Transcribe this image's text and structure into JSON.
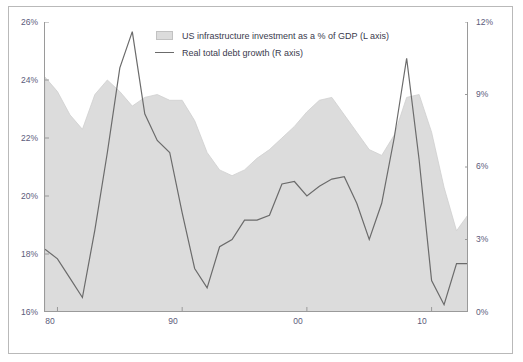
{
  "chart_data": {
    "type": "area",
    "title": "",
    "xlabel": "",
    "ylabel": "",
    "grid": false,
    "legend_position": "top-center",
    "x_tick_labels": [
      "80",
      "90",
      "00",
      "10"
    ],
    "x_tick_values": [
      1980,
      1990,
      2000,
      2010
    ],
    "xlim": [
      1979,
      2013
    ],
    "left_axis": {
      "label": "US infrastructure investment as a % of GDP (L axis)",
      "tick_labels": [
        "16%",
        "18%",
        "20%",
        "22%",
        "24%",
        "26%"
      ],
      "tick_values": [
        16,
        18,
        20,
        22,
        24,
        26
      ],
      "ylim": [
        16,
        26
      ],
      "color": "#dcdcdc"
    },
    "right_axis": {
      "label": "Real total debt growth (R axis)",
      "tick_labels": [
        "0%",
        "3%",
        "6%",
        "9%",
        "12%"
      ],
      "tick_values": [
        0,
        3,
        6,
        9,
        12
      ],
      "ylim": [
        0,
        12
      ],
      "color": "#6b6b6b"
    },
    "series": [
      {
        "name": "US infrastructure investment as a % of GDP (L axis)",
        "axis": "left",
        "type": "area",
        "x": [
          1979,
          1980,
          1981,
          1982,
          1983,
          1984,
          1985,
          1986,
          1987,
          1988,
          1989,
          1990,
          1991,
          1992,
          1993,
          1994,
          1995,
          1996,
          1997,
          1998,
          1999,
          2000,
          2001,
          2002,
          2003,
          2004,
          2005,
          2006,
          2007,
          2008,
          2009,
          2010,
          2011,
          2012,
          2013
        ],
        "values": [
          24.1,
          23.6,
          22.8,
          22.3,
          23.5,
          24.0,
          23.6,
          23.1,
          23.4,
          23.5,
          23.3,
          23.3,
          22.6,
          21.5,
          20.9,
          20.7,
          20.9,
          21.3,
          21.6,
          22.0,
          22.4,
          22.9,
          23.3,
          23.4,
          22.8,
          22.2,
          21.6,
          21.4,
          22.1,
          23.4,
          23.5,
          22.2,
          20.3,
          18.8,
          19.4
        ]
      },
      {
        "name": "Real total debt growth (R axis)",
        "axis": "right",
        "type": "line",
        "x": [
          1979,
          1980,
          1981,
          1982,
          1983,
          1984,
          1985,
          1986,
          1987,
          1988,
          1989,
          1990,
          1991,
          1992,
          1993,
          1994,
          1995,
          1996,
          1997,
          1998,
          1999,
          2000,
          2001,
          2002,
          2003,
          2004,
          2005,
          2006,
          2007,
          2008,
          2009,
          2010,
          2011,
          2012,
          2013
        ],
        "values": [
          2.6,
          2.2,
          1.4,
          0.6,
          3.4,
          6.6,
          10.1,
          11.6,
          8.2,
          7.1,
          6.6,
          4.1,
          1.8,
          1.0,
          2.7,
          3.0,
          3.8,
          3.8,
          4.0,
          5.3,
          5.4,
          4.8,
          5.2,
          5.5,
          5.6,
          4.5,
          3.0,
          4.5,
          7.2,
          10.5,
          6.3,
          1.3,
          0.3,
          2.0,
          2.0
        ]
      }
    ]
  },
  "legend": {
    "items": [
      {
        "label": "US infrastructure investment as a % of GDP (L axis)",
        "marker": "box"
      },
      {
        "label": "Real total debt growth (R axis)",
        "marker": "line"
      }
    ]
  },
  "axis_left_ticks": [
    {
      "label": "26%",
      "value": 26
    },
    {
      "label": "24%",
      "value": 24
    },
    {
      "label": "22%",
      "value": 22
    },
    {
      "label": "20%",
      "value": 20
    },
    {
      "label": "18%",
      "value": 18
    },
    {
      "label": "16%",
      "value": 16
    }
  ],
  "axis_right_ticks": [
    {
      "label": "12%",
      "value": 12
    },
    {
      "label": "9%",
      "value": 9
    },
    {
      "label": "6%",
      "value": 6
    },
    {
      "label": "3%",
      "value": 3
    },
    {
      "label": "0%",
      "value": 0
    }
  ],
  "axis_x_ticks": [
    {
      "label": "80",
      "value": 1980
    },
    {
      "label": "90",
      "value": 1990
    },
    {
      "label": "00",
      "value": 2000
    },
    {
      "label": "10",
      "value": 2010
    }
  ]
}
